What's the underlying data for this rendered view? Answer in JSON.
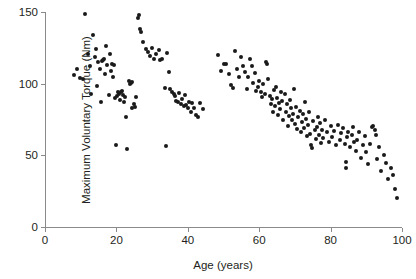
{
  "chart_data": {
    "type": "scatter",
    "title": "",
    "xlabel": "Age (years)",
    "ylabel": "Maximum Voluntary Torque (Nm)",
    "xlim": [
      0,
      100
    ],
    "ylim": [
      0,
      150
    ],
    "xticks": [
      0,
      20,
      40,
      60,
      80,
      100
    ],
    "yticks": [
      0,
      50,
      100,
      150
    ],
    "xtick_labels": [
      "0",
      "20",
      "40",
      "60",
      "80",
      "100"
    ],
    "ytick_labels": [
      "0",
      "50",
      "100",
      "150"
    ],
    "grid": false,
    "legend": null,
    "marker": {
      "shape": "circle",
      "color": "#1a1a1a",
      "size": 4
    },
    "points": [
      [
        8.1,
        106.0
      ],
      [
        9.0,
        110.5
      ],
      [
        9.8,
        104.0
      ],
      [
        10.6,
        103.0
      ],
      [
        11.3,
        148.5
      ],
      [
        12.1,
        121.0
      ],
      [
        12.6,
        112.5
      ],
      [
        13.0,
        93.0
      ],
      [
        13.4,
        134.0
      ],
      [
        13.9,
        118.5
      ],
      [
        14.3,
        124.0
      ],
      [
        14.6,
        98.5
      ],
      [
        14.9,
        115.0
      ],
      [
        15.3,
        110.0
      ],
      [
        15.6,
        87.0
      ],
      [
        15.9,
        116.0
      ],
      [
        16.3,
        116.5
      ],
      [
        16.6,
        117.0
      ],
      [
        16.9,
        107.0
      ],
      [
        17.2,
        126.5
      ],
      [
        17.5,
        113.0
      ],
      [
        17.8,
        92.0
      ],
      [
        18.1,
        121.0
      ],
      [
        18.4,
        109.0
      ],
      [
        18.7,
        113.5
      ],
      [
        19.0,
        105.0
      ],
      [
        19.3,
        113.0
      ],
      [
        19.6,
        90.0
      ],
      [
        19.8,
        57.0
      ],
      [
        20.1,
        91.5
      ],
      [
        20.4,
        94.5
      ],
      [
        20.7,
        92.5
      ],
      [
        21.0,
        88.5
      ],
      [
        21.3,
        94.0
      ],
      [
        21.6,
        95.0
      ],
      [
        21.9,
        92.0
      ],
      [
        22.2,
        87.0
      ],
      [
        22.5,
        90.5
      ],
      [
        22.8,
        77.0
      ],
      [
        23.1,
        54.5
      ],
      [
        23.4,
        102.0
      ],
      [
        23.7,
        99.5
      ],
      [
        24.0,
        100.5
      ],
      [
        24.3,
        101.5
      ],
      [
        24.5,
        83.0
      ],
      [
        24.8,
        85.5
      ],
      [
        25.1,
        84.0
      ],
      [
        25.4,
        90.5
      ],
      [
        26.0,
        145.5
      ],
      [
        26.3,
        148.0
      ],
      [
        26.6,
        138.0
      ],
      [
        27.0,
        136.0
      ],
      [
        27.5,
        129.0
      ],
      [
        28.2,
        124.5
      ],
      [
        28.8,
        122.0
      ],
      [
        29.4,
        119.0
      ],
      [
        30.0,
        125.0
      ],
      [
        30.6,
        117.0
      ],
      [
        31.2,
        120.5
      ],
      [
        31.8,
        123.5
      ],
      [
        32.3,
        116.5
      ],
      [
        32.9,
        117.0
      ],
      [
        33.5,
        97.0
      ],
      [
        33.9,
        56.5
      ],
      [
        34.2,
        121.5
      ],
      [
        34.6,
        108.0
      ],
      [
        35.0,
        96.0
      ],
      [
        35.5,
        94.0
      ],
      [
        36.0,
        92.5
      ],
      [
        36.4,
        91.5
      ],
      [
        36.8,
        88.0
      ],
      [
        37.2,
        87.5
      ],
      [
        37.6,
        93.5
      ],
      [
        38.0,
        86.0
      ],
      [
        38.4,
        89.0
      ],
      [
        38.8,
        84.5
      ],
      [
        39.2,
        92.0
      ],
      [
        39.6,
        85.0
      ],
      [
        40.0,
        83.0
      ],
      [
        40.4,
        87.5
      ],
      [
        40.8,
        80.5
      ],
      [
        41.2,
        86.5
      ],
      [
        41.7,
        83.0
      ],
      [
        42.2,
        78.0
      ],
      [
        42.8,
        77.0
      ],
      [
        43.5,
        86.5
      ],
      [
        44.2,
        82.0
      ],
      [
        48.5,
        120.0
      ],
      [
        49.2,
        108.5
      ],
      [
        50.0,
        114.0
      ],
      [
        50.8,
        113.5
      ],
      [
        51.5,
        106.5
      ],
      [
        52.0,
        99.0
      ],
      [
        52.6,
        97.0
      ],
      [
        53.2,
        123.0
      ],
      [
        53.8,
        110.0
      ],
      [
        54.4,
        104.5
      ],
      [
        55.0,
        118.5
      ],
      [
        55.5,
        112.0
      ],
      [
        56.0,
        108.0
      ],
      [
        56.5,
        96.5
      ],
      [
        57.0,
        105.0
      ],
      [
        57.5,
        117.5
      ],
      [
        58.0,
        112.5
      ],
      [
        58.4,
        100.5
      ],
      [
        58.8,
        107.5
      ],
      [
        59.2,
        95.0
      ],
      [
        59.6,
        98.0
      ],
      [
        60.0,
        102.0
      ],
      [
        60.4,
        94.5
      ],
      [
        60.8,
        91.0
      ],
      [
        61.2,
        99.5
      ],
      [
        61.6,
        93.0
      ],
      [
        62.0,
        115.0
      ],
      [
        62.3,
        113.5
      ],
      [
        62.6,
        103.0
      ],
      [
        62.9,
        91.5
      ],
      [
        63.2,
        86.0
      ],
      [
        63.5,
        89.0
      ],
      [
        63.8,
        80.5
      ],
      [
        64.1,
        95.5
      ],
      [
        64.4,
        84.5
      ],
      [
        64.7,
        98.0
      ],
      [
        65.0,
        90.0
      ],
      [
        65.3,
        78.0
      ],
      [
        65.6,
        86.5
      ],
      [
        65.9,
        82.0
      ],
      [
        66.2,
        94.0
      ],
      [
        66.5,
        88.0
      ],
      [
        66.8,
        75.0
      ],
      [
        67.1,
        92.5
      ],
      [
        67.4,
        80.0
      ],
      [
        67.7,
        85.5
      ],
      [
        68.0,
        70.5
      ],
      [
        68.3,
        77.5
      ],
      [
        68.6,
        88.5
      ],
      [
        68.9,
        83.0
      ],
      [
        69.2,
        74.5
      ],
      [
        69.5,
        79.0
      ],
      [
        69.8,
        96.0
      ],
      [
        70.1,
        72.0
      ],
      [
        70.4,
        84.0
      ],
      [
        70.7,
        68.5
      ],
      [
        71.0,
        76.5
      ],
      [
        71.3,
        81.0
      ],
      [
        71.6,
        66.0
      ],
      [
        71.9,
        73.0
      ],
      [
        72.2,
        78.5
      ],
      [
        72.5,
        69.0
      ],
      [
        72.8,
        87.0
      ],
      [
        73.1,
        75.5
      ],
      [
        73.4,
        63.5
      ],
      [
        73.7,
        71.0
      ],
      [
        74.0,
        80.0
      ],
      [
        74.3,
        65.0
      ],
      [
        74.6,
        57.5
      ],
      [
        74.9,
        55.0
      ],
      [
        75.2,
        74.0
      ],
      [
        75.5,
        67.5
      ],
      [
        75.8,
        61.5
      ],
      [
        76.1,
        70.0
      ],
      [
        76.4,
        77.0
      ],
      [
        76.7,
        64.0
      ],
      [
        77.0,
        72.5
      ],
      [
        77.3,
        58.5
      ],
      [
        77.6,
        68.0
      ],
      [
        78.0,
        62.0
      ],
      [
        78.5,
        74.5
      ],
      [
        79.0,
        66.5
      ],
      [
        79.5,
        59.5
      ],
      [
        80.0,
        70.5
      ],
      [
        80.5,
        63.0
      ],
      [
        81.0,
        67.0
      ],
      [
        81.5,
        57.0
      ],
      [
        82.0,
        71.5
      ],
      [
        82.5,
        60.5
      ],
      [
        83.0,
        65.5
      ],
      [
        83.5,
        69.0
      ],
      [
        84.0,
        58.0
      ],
      [
        84.3,
        45.5
      ],
      [
        84.3,
        41.5
      ],
      [
        84.6,
        62.5
      ],
      [
        85.0,
        66.5
      ],
      [
        85.5,
        55.5
      ],
      [
        86.0,
        64.0
      ],
      [
        86.3,
        70.0
      ],
      [
        86.6,
        59.0
      ],
      [
        87.0,
        53.0
      ],
      [
        87.5,
        61.0
      ],
      [
        88.0,
        66.0
      ],
      [
        88.5,
        48.0
      ],
      [
        89.0,
        57.5
      ],
      [
        89.5,
        63.5
      ],
      [
        90.0,
        52.5
      ],
      [
        90.5,
        44.0
      ],
      [
        91.0,
        58.0
      ],
      [
        91.5,
        69.5
      ],
      [
        92.0,
        70.5
      ],
      [
        92.3,
        68.0
      ],
      [
        92.6,
        64.5
      ],
      [
        93.0,
        47.5
      ],
      [
        93.5,
        56.0
      ],
      [
        94.0,
        39.0
      ],
      [
        95.0,
        50.0
      ],
      [
        95.5,
        45.0
      ],
      [
        96.0,
        33.5
      ],
      [
        97.0,
        41.0
      ],
      [
        97.5,
        36.0
      ],
      [
        98.0,
        26.5
      ],
      [
        98.5,
        20.0
      ]
    ]
  }
}
